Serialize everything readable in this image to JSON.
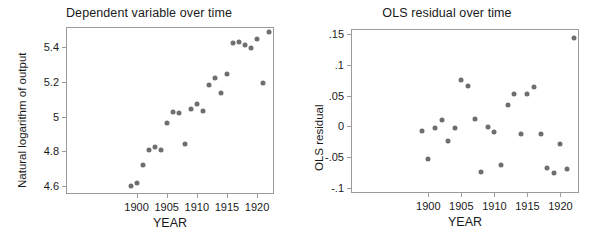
{
  "figure": {
    "background": "#ffffff",
    "marker_color": "#6e6e6e",
    "axis_color": "#9a9a9a",
    "text_color": "#1a1a1a"
  },
  "chart_data": [
    {
      "type": "scatter",
      "title": "Dependent variable over time",
      "xlabel": "YEAR",
      "ylabel": "Natural logarithm of output",
      "xlim": [
        1888.3,
        1922.8
      ],
      "ylim": [
        4.555,
        5.515
      ],
      "grid": false,
      "legend": null,
      "xticks": [
        1900,
        1905,
        1910,
        1915,
        1920
      ],
      "xticklabels": [
        "1900",
        "1905",
        "1910",
        "1915",
        "1920"
      ],
      "yticks": [
        4.6,
        4.8,
        5,
        5.2,
        5.4
      ],
      "yticklabels": [
        "4.6",
        "4.8",
        "5",
        "5.2",
        "5.4"
      ],
      "x": [
        1899,
        1900,
        1901,
        1902,
        1903,
        1904,
        1905,
        1906,
        1907,
        1908,
        1909,
        1910,
        1911,
        1912,
        1913,
        1914,
        1915,
        1916,
        1917,
        1918,
        1919,
        1920,
        1921,
        1922
      ],
      "y": [
        4.601,
        4.616,
        4.721,
        4.806,
        4.824,
        4.808,
        4.966,
        5.027,
        5.021,
        4.842,
        5.046,
        5.073,
        5.035,
        5.182,
        5.221,
        5.135,
        5.246,
        5.421,
        5.428,
        5.412,
        5.392,
        5.447,
        5.194,
        5.484
      ]
    },
    {
      "type": "scatter",
      "title": "OLS residual over time",
      "xlabel": "YEAR",
      "ylabel": "OLS residual",
      "xlim": [
        1888.3,
        1922.8
      ],
      "ylim": [
        -0.108,
        0.158
      ],
      "grid": false,
      "legend": null,
      "xticks": [
        1900,
        1905,
        1910,
        1915,
        1920
      ],
      "xticklabels": [
        "1900",
        "1905",
        "1910",
        "1915",
        "1920"
      ],
      "yticks": [
        0.15,
        0.1,
        0.05,
        0,
        -0.05,
        -0.1
      ],
      "yticklabels": [
        ".15",
        ".1",
        ".05",
        "0",
        "-.05",
        "-.1"
      ],
      "x": [
        1899,
        1900,
        1901,
        1902,
        1903,
        1904,
        1905,
        1906,
        1907,
        1908,
        1909,
        1910,
        1911,
        1912,
        1913,
        1914,
        1915,
        1916,
        1917,
        1918,
        1919,
        1920,
        1921,
        1922
      ],
      "y": [
        -0.008,
        -0.053,
        -0.002,
        0.011,
        -0.023,
        -0.003,
        0.076,
        0.066,
        0.012,
        -0.074,
        -0.001,
        -0.009,
        -0.062,
        0.035,
        0.052,
        -0.012,
        0.052,
        0.064,
        -0.012,
        -0.068,
        -0.075,
        -0.029,
        -0.069,
        0.143
      ]
    }
  ]
}
